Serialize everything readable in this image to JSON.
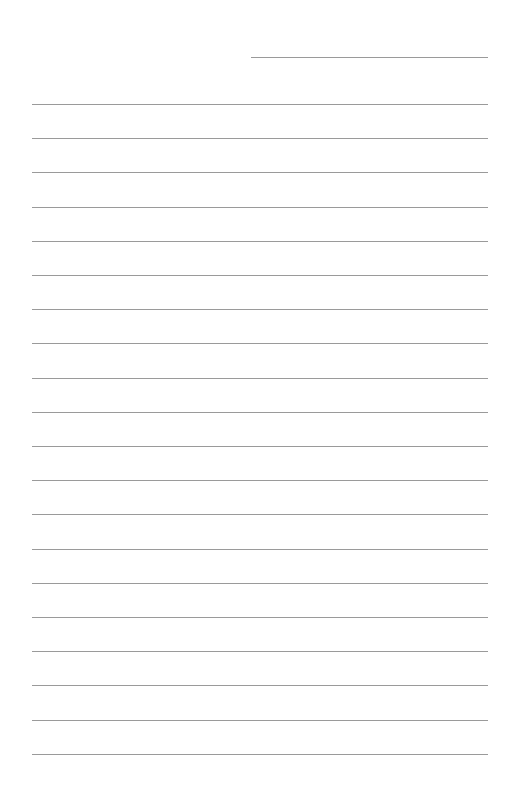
{
  "page": {
    "type": "lined-paper",
    "background": "#ffffff",
    "line_color": "#9a9a9a",
    "header_line": {
      "x1": 251,
      "x2": 488,
      "y": 57
    },
    "ruled_lines": {
      "count": 20,
      "x1": 32,
      "x2": 488,
      "first_y": 104,
      "spacing": 34.2
    }
  }
}
